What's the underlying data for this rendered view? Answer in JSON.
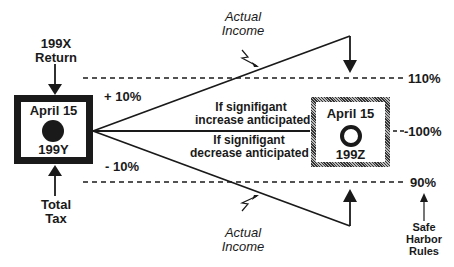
{
  "diagram": {
    "left_box": {
      "title": "April 15",
      "year": "199Y",
      "marker": "filled-circle"
    },
    "right_box": {
      "title": "April 15",
      "year": "199Z",
      "marker": "open-circle"
    },
    "top_label": {
      "line1": "199X",
      "line2": "Return"
    },
    "bottom_label": {
      "line1": "Total",
      "line2": "Tax"
    },
    "plus_label": "+ 10%",
    "minus_label": "- 10%",
    "increase_label": {
      "line1": "If signifigant",
      "line2": "increase anticipated"
    },
    "decrease_label": {
      "line1": "If signifigant",
      "line2": "decrease anticipated"
    },
    "actual_income_top": {
      "line1": "Actual",
      "line2": "Income"
    },
    "actual_income_bottom": {
      "line1": "Actual",
      "line2": "Income"
    },
    "thresholds": {
      "upper": "110%",
      "middle": "-100%",
      "lower": "90%"
    },
    "safe_harbor": {
      "line1": "Safe",
      "line2": "Harbor",
      "line3": "Rules"
    }
  }
}
